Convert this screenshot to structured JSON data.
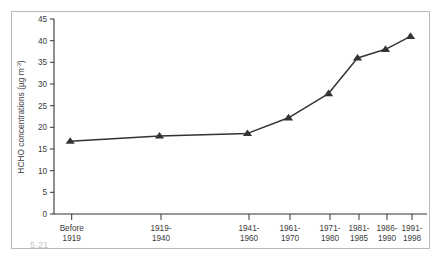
{
  "figure": {
    "caption_number": "5.21",
    "background_color": "#ffffff",
    "frame_color": "#b9b9b9"
  },
  "chart_data": {
    "type": "line",
    "title": "",
    "subtitle": "",
    "xlabel": "",
    "ylabel": "HCHO concentrations (µg m⁻³)",
    "ylabel_main": "HCHO concentrations (µg m",
    "ylabel_exponent": "-3",
    "ylabel_close": ")",
    "categories": [
      "Before\n1919",
      "1919-\n1940",
      "1941-\n1960",
      "1961-\n1970",
      "1971-\n1980",
      "1981-\n1985",
      "1986-\n1990",
      "1991-\n1998"
    ],
    "category_lines": [
      [
        "Before",
        "1919"
      ],
      [
        "1919-",
        "1940"
      ],
      [
        "1941-",
        "1960"
      ],
      [
        "1961-",
        "1970"
      ],
      [
        "1971-",
        "1980"
      ],
      [
        "1981-",
        "1985"
      ],
      [
        "1986-",
        "1990"
      ],
      [
        "1991-",
        "1998"
      ]
    ],
    "values": [
      16.8,
      18.0,
      18.6,
      22.2,
      27.8,
      36.0,
      38.0,
      41.0
    ],
    "x_positions_px": [
      70.7,
      160.0,
      248.0,
      289.0,
      329.0,
      358.0,
      386.0,
      411.0
    ],
    "ylim": [
      0,
      45
    ],
    "yticks": [
      0,
      5,
      10,
      15,
      20,
      25,
      30,
      35,
      40,
      45
    ],
    "ytick_labels": [
      "0",
      "5",
      "10",
      "15",
      "20",
      "25",
      "30",
      "35",
      "40",
      "45"
    ],
    "grid": false,
    "legend": null,
    "legend_position": "none",
    "marker": "triangle",
    "line_color": "#333333",
    "marker_color": "#333333",
    "series": [
      {
        "name": "HCHO concentrations",
        "values": [
          16.8,
          18.0,
          18.6,
          22.2,
          27.8,
          36.0,
          38.0,
          41.0
        ]
      }
    ]
  }
}
